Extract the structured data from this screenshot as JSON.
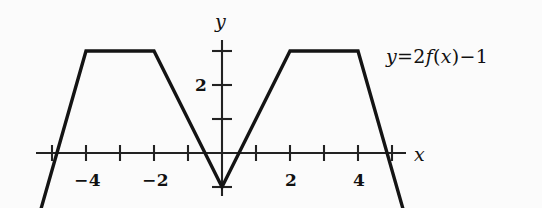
{
  "figure": {
    "background_color": "#fbfbfb",
    "ink_color": "#111111"
  },
  "axes": {
    "x_axis_label": "x",
    "y_axis_label": "y",
    "x_ticks": [
      {
        "value": -5,
        "label": ""
      },
      {
        "value": -4,
        "label": "−4"
      },
      {
        "value": -3,
        "label": ""
      },
      {
        "value": -2,
        "label": "−2"
      },
      {
        "value": -1,
        "label": ""
      },
      {
        "value": 1,
        "label": ""
      },
      {
        "value": 2,
        "label": "2"
      },
      {
        "value": 3,
        "label": ""
      },
      {
        "value": 4,
        "label": "4"
      },
      {
        "value": 5,
        "label": ""
      }
    ],
    "y_ticks": [
      {
        "value": -1,
        "label": ""
      },
      {
        "value": 1,
        "label": ""
      },
      {
        "value": 2,
        "label": "2"
      },
      {
        "value": 3,
        "label": ""
      }
    ]
  },
  "annotation": {
    "equation_y": "y",
    "equation_eq": "=",
    "equation_coeff": "2",
    "equation_fn": "f",
    "equation_open": "(",
    "equation_var": "x",
    "equation_close": ")",
    "equation_minus": "−",
    "equation_const": "1",
    "equation_full": "y = 2f(x) − 1"
  },
  "chart_data": {
    "type": "line",
    "title": "",
    "xlabel": "x",
    "ylabel": "y",
    "xlim": [
      -5.6,
      5.6
    ],
    "ylim": [
      -1.7,
      3.6
    ],
    "grid": false,
    "legend": null,
    "annotations": [
      {
        "text": "y = 2f(x) − 1",
        "x": 5.9,
        "y": 2.95
      }
    ],
    "series": [
      {
        "name": "y = 2f(x) - 1",
        "kind": "piecewise-linear",
        "x": [
          -5.32,
          -4,
          -2,
          0,
          2,
          4,
          5.32
        ],
        "y": [
          -1.63,
          3,
          3,
          -1,
          3,
          3,
          -1.63
        ]
      }
    ],
    "x_tick_values": [
      -5,
      -4,
      -3,
      -2,
      -1,
      1,
      2,
      3,
      4,
      5
    ],
    "x_tick_labels": [
      "",
      "−4",
      "",
      "−2",
      "",
      "",
      "2",
      "",
      "4",
      ""
    ],
    "y_tick_values": [
      -1,
      1,
      2,
      3
    ],
    "y_tick_labels": [
      "",
      "",
      "2",
      ""
    ]
  }
}
